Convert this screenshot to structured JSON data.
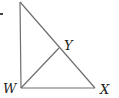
{
  "diagram": {
    "type": "geometry-triangle",
    "stroke_color": "#6e6e6e",
    "label_color": "#222222",
    "vertices": {
      "top": {
        "x": 20,
        "y": 2,
        "label": ""
      },
      "W": {
        "x": 21,
        "y": 88,
        "label": "W"
      },
      "X": {
        "x": 95,
        "y": 88,
        "label": "X"
      },
      "Y": {
        "x": 59,
        "y": 48,
        "label": "Y"
      }
    },
    "segments": [
      [
        "top",
        "W"
      ],
      [
        "W",
        "X"
      ],
      [
        "top",
        "X"
      ],
      [
        "W",
        "Y"
      ]
    ],
    "labels": {
      "W": "W",
      "X": "X",
      "Y": "Y"
    }
  }
}
